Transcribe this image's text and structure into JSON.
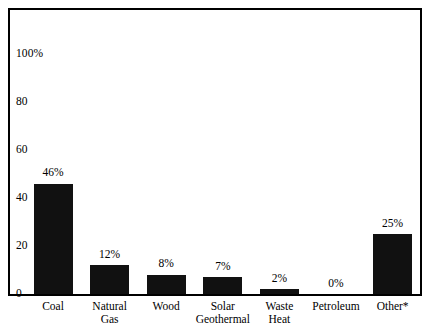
{
  "chart_data": {
    "type": "bar",
    "title": "",
    "subtitle": "",
    "xlabel": "",
    "ylabel": "",
    "ylim": [
      0,
      110
    ],
    "grid": false,
    "legend": null,
    "yticks": [
      {
        "value": 100,
        "label": "100%"
      },
      {
        "value": 80,
        "label": "80"
      },
      {
        "value": 60,
        "label": "60"
      },
      {
        "value": 40,
        "label": "40"
      },
      {
        "value": 20,
        "label": "20"
      },
      {
        "value": 0,
        "label": "0"
      }
    ],
    "categories": [
      "Coal",
      "Natural Gas",
      "Wood",
      "Solar Geothermal",
      "Waste Heat",
      "Petroleum",
      "Other*"
    ],
    "category_lines": [
      [
        "Coal"
      ],
      [
        "Natural",
        "Gas"
      ],
      [
        "Wood"
      ],
      [
        "Solar",
        "Geothermal"
      ],
      [
        "Waste",
        "Heat"
      ],
      [
        "Petroleum"
      ],
      [
        "Other*"
      ]
    ],
    "values": [
      46,
      12,
      8,
      7,
      2,
      0,
      25
    ],
    "value_labels": [
      "46%",
      "12%",
      "8%",
      "7%",
      "2%",
      "0%",
      "25%"
    ],
    "bar_color": "#111111",
    "frame_color": "#000000",
    "background_color": "#ffffff"
  }
}
